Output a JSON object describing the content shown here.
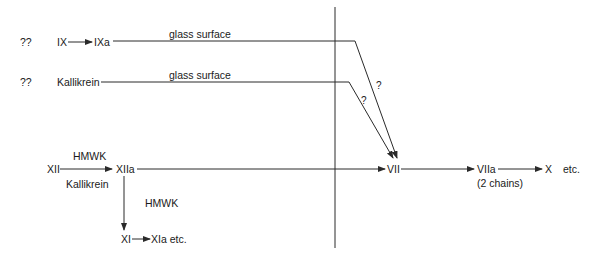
{
  "diagram": {
    "type": "coagulation-cascade",
    "row1": {
      "unknown": "??",
      "from": "IX",
      "to": "IXa",
      "edge_label": "glass surface",
      "join_label": "?"
    },
    "row2": {
      "unknown": "??",
      "from": "Kallikrein",
      "edge_label": "glass surface",
      "join_label": "?"
    },
    "row3": {
      "from": "XII",
      "edge_label_top": "HMWK",
      "edge_label_bottom": "Kallikrein",
      "to": "XIIa",
      "target": "VII",
      "next": "VIIa",
      "next_note": "(2 chains)",
      "final": "X",
      "final_suffix": "etc."
    },
    "branch": {
      "edge_label": "HMWK",
      "from": "XI",
      "to": "XIa etc."
    },
    "colors": {
      "line": "#2a2a2a",
      "text": "#1a1a1a",
      "background": "#ffffff"
    }
  }
}
